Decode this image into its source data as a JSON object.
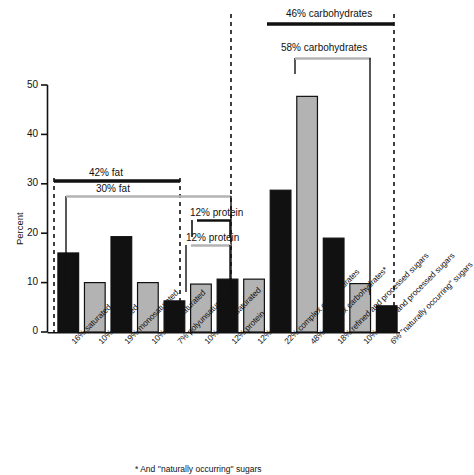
{
  "chart_data": {
    "type": "bar",
    "title": "",
    "xlabel": "",
    "ylabel": "Percent",
    "ylim": [
      0,
      50
    ],
    "yticks": [
      0,
      10,
      20,
      30,
      40,
      50
    ],
    "ytick_labels": [
      "0",
      "10",
      "20",
      "30",
      "40",
      "50"
    ],
    "grid": false,
    "legend_position": "none",
    "categories": [
      "16% saturated",
      "10% saturated",
      "19% monosaturated",
      "10% monosaturated",
      "7% polyunsaturated",
      "10% polyunsaturated",
      "12% protein",
      "12% protein",
      "22% complex carbohydrates",
      "48% complex carbohydrates*",
      "18% refined and processed sugars",
      "10% refined and processed sugars",
      "6% ''naturally occurring'' sugars"
    ],
    "values": [
      16,
      10,
      19.3,
      10,
      6.3,
      9.7,
      10.7,
      10.7,
      28.7,
      47.7,
      19,
      9.8,
      5.3
    ],
    "bar_colors": [
      "#111111",
      "#b3b3b3",
      "#111111",
      "#b3b3b3",
      "#111111",
      "#b3b3b3",
      "#111111",
      "#b3b3b3",
      "#111111",
      "#b3b3b3",
      "#111111",
      "#b3b3b3",
      "#111111"
    ],
    "series": [
      {
        "name": "current diet",
        "color": "#111111",
        "points": [
          {
            "category": "16% saturated",
            "value": 16
          },
          {
            "category": "19% monosaturated",
            "value": 19.3
          },
          {
            "category": "7% polyunsaturated",
            "value": 6.3
          },
          {
            "category": "12% protein",
            "value": 10.7
          },
          {
            "category": "22% complex carbohydrates",
            "value": 28.7
          },
          {
            "category": "18% refined and processed sugars",
            "value": 19
          },
          {
            "category": "6% ''naturally occurring'' sugars",
            "value": 5.3
          }
        ]
      },
      {
        "name": "recommended diet",
        "color": "#b3b3b3",
        "points": [
          {
            "category": "10% saturated",
            "value": 10
          },
          {
            "category": "10% monosaturated",
            "value": 10
          },
          {
            "category": "10% polyunsaturated",
            "value": 9.7
          },
          {
            "category": "12% protein",
            "value": 10.7
          },
          {
            "category": "48% complex carbohydrates*",
            "value": 47.7
          },
          {
            "category": "10% refined and processed sugars",
            "value": 9.8
          }
        ]
      }
    ],
    "annotations": [
      {
        "name": "fat-black-bracket",
        "label": "42% fat",
        "color": "#111111",
        "spans": [
          "16% saturated",
          "10% polyunsaturated"
        ]
      },
      {
        "name": "fat-gray-bracket",
        "label": "30% fat",
        "color": "#b3b3b3",
        "spans": [
          "10% saturated",
          "10% polyunsaturated"
        ]
      },
      {
        "name": "protein-black-bracket",
        "label": "12% protein",
        "color": "#111111",
        "spans": [
          "12% protein",
          "12% protein"
        ]
      },
      {
        "name": "protein-gray-bracket",
        "label": "12% protein",
        "color": "#b3b3b3",
        "spans": [
          "12% protein",
          "12% protein"
        ]
      },
      {
        "name": "carb-black-bracket",
        "label": "46% carbohydrates",
        "color": "#111111",
        "spans": [
          "22% complex carbohydrates",
          "6% ''naturally occurring'' sugars"
        ]
      },
      {
        "name": "carb-gray-bracket",
        "label": "58% carbohydrates",
        "color": "#b3b3b3",
        "spans": [
          "48% complex carbohydrates*",
          "10% refined and processed sugars"
        ]
      }
    ],
    "group_dividers": 3,
    "footnote": "* And ''naturally occurring'' sugars"
  },
  "axis": {
    "y_title": "Percent",
    "y_labels": [
      "50",
      "40",
      "30",
      "20",
      "10",
      "0"
    ]
  },
  "annotations": {
    "fat_black": "42% fat",
    "fat_gray": "30% fat",
    "protein_black": "12% protein",
    "protein_gray": "12% protein",
    "carb_black": "46% carbohydrates",
    "carb_gray": "58% carbohydrates"
  },
  "xlabels": [
    "16% saturated",
    "10% saturated",
    "19% monosaturated",
    "10% monosaturated",
    "7% polyunsaturated",
    "10% polyunsaturated",
    "12% protein",
    "12% protein",
    "22% complex carbohydrates",
    "48% complex carbohydrates*",
    "18% refined and processed sugars",
    "10% refined and processed sugars",
    "6% ''naturally occurring'' sugars"
  ],
  "footnote": "* And ''naturally occurring'' sugars"
}
